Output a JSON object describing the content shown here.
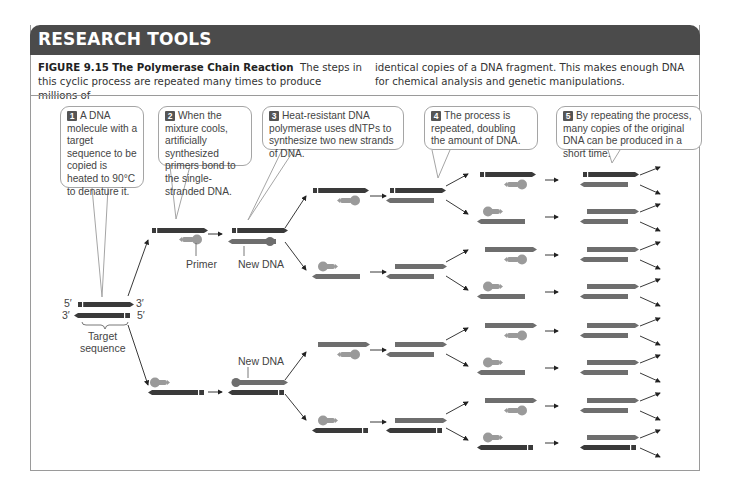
{
  "banner": {
    "title": "RESEARCH TOOLS"
  },
  "caption": {
    "figure_number": "FIGURE 9.15",
    "figure_title": "The Polymerase Chain Reaction",
    "left_text": "The steps in this cyclic process are repeated many times to produce millions of",
    "right_text": "identical copies of a DNA fragment. This makes enough DNA for chemical analysis and genetic manipulations."
  },
  "steps": [
    {
      "number": "1",
      "text": "A DNA molecule with a target sequence to be copied is heated to 90°C to denature it."
    },
    {
      "number": "2",
      "text": "When the mixture cools, artificially synthesized primers bond to the single-stranded DNA."
    },
    {
      "number": "3",
      "text": "Heat-resistant DNA polymerase uses dNTPs to synthesize two new strands of DNA."
    },
    {
      "number": "4",
      "text": "The process is repeated, doubling the amount of DNA."
    },
    {
      "number": "5",
      "text": "By repeating the process, many copies of the original DNA can be produced in a short time."
    }
  ],
  "labels": {
    "five_prime_top": "5′",
    "three_prime_top": "3′",
    "three_prime_bottom": "3′",
    "five_prime_bottom": "5′",
    "target_sequence_line1": "Target",
    "target_sequence_line2": "sequence",
    "primer": "Primer",
    "new_dna_top": "New DNA",
    "new_dna_bottom": "New DNA"
  },
  "colors": {
    "banner": "#4b4b4b",
    "original_strand": "#3a3a3a",
    "new_strand": "#6e6e6e",
    "primer": "#9a9a9a",
    "border": "#a5a5a5"
  }
}
